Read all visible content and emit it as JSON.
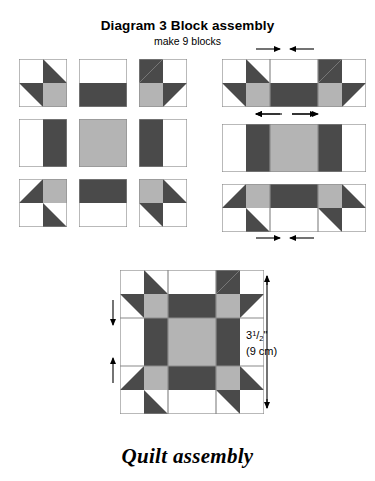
{
  "title": "Diagram 3  Block assembly",
  "subtitle": "make 9 blocks",
  "footer": "Quilt assembly",
  "dimension": {
    "whole": "3",
    "numerator": "1",
    "slash": "/",
    "denominator": "2",
    "unit": "\"",
    "metric": "(9 cm)"
  },
  "colors": {
    "dark": "#4a4a4a",
    "gray": "#b4b4b4",
    "white": "#ffffff",
    "outline": "#8a8a8a",
    "ink": "#000000"
  },
  "patch_grid": {
    "description": "3 x 3 exploded block units",
    "rows": [
      [
        {
          "name": "corner-unit-top-left",
          "patches": [
            "white",
            "dark-triangle",
            "dark-triangle",
            "gray"
          ]
        },
        {
          "name": "side-unit-top",
          "patches": [
            "white",
            "dark"
          ]
        },
        {
          "name": "corner-unit-top-right",
          "patches": [
            "dark-triangle",
            "white",
            "gray",
            "dark-triangle"
          ]
        }
      ],
      [
        {
          "name": "side-unit-left",
          "patches": [
            "white",
            "dark"
          ]
        },
        {
          "name": "center-unit",
          "patches": [
            "gray"
          ]
        },
        {
          "name": "side-unit-right",
          "patches": [
            "dark",
            "white"
          ]
        }
      ],
      [
        {
          "name": "corner-unit-bottom-left",
          "patches": [
            "white",
            "gray",
            "dark-triangle",
            "white"
          ]
        },
        {
          "name": "side-unit-bottom",
          "patches": [
            "dark",
            "white"
          ]
        },
        {
          "name": "corner-unit-bottom-right",
          "patches": [
            "gray",
            "dark-triangle",
            "dark-triangle",
            "white"
          ]
        }
      ]
    ]
  },
  "row_strips": [
    {
      "name": "row-strip-top",
      "seam_arrows_above": "inward",
      "seam_arrows_below": "outward"
    },
    {
      "name": "row-strip-middle",
      "seam_arrows_above": "outward",
      "seam_arrows_below": "none"
    },
    {
      "name": "row-strip-bottom",
      "seam_arrows_above": "none",
      "seam_arrows_below": "inward"
    }
  ],
  "finished_block": {
    "name": "finished-block",
    "pattern": "star block with gray center square, dark star points, gray corner squares, white background corners",
    "seam_arrows_left": "toward-seams"
  }
}
